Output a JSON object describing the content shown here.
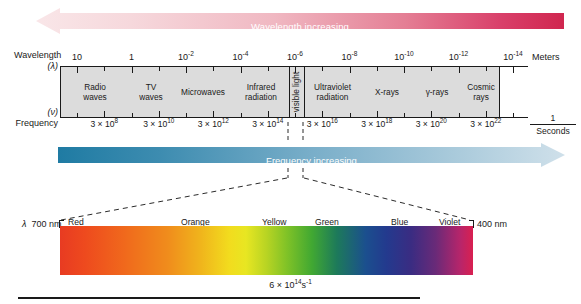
{
  "figure": {
    "top_arrow": {
      "label": "Wavelength increasing",
      "direction": "left",
      "color_start": "#f7dfe2",
      "color_end": "#d42a55"
    },
    "bottom_arrow": {
      "label": "Frequency increasing",
      "direction": "right",
      "color_start": "#2b7fa8",
      "color_end": "#c8dce8"
    },
    "wavelength_axis": {
      "caption_line1": "Wavelength",
      "caption_line2": "(λ)",
      "unit_label": "Meters",
      "tick_labels": [
        "10",
        "1",
        "10⁻²",
        "10⁻⁴",
        "10⁻⁶",
        "10⁻⁸",
        "10⁻¹⁰",
        "10⁻¹²",
        "10⁻¹⁴"
      ],
      "tick_bases": [
        "10",
        "1",
        "10",
        "10",
        "10",
        "10",
        "10",
        "10",
        "10"
      ],
      "tick_exponents": [
        "",
        "",
        "-2",
        "-4",
        "-6",
        "-8",
        "-10",
        "-12",
        "-14"
      ]
    },
    "frequency_axis": {
      "caption_line1": "(ν)",
      "caption_line2": "Frequency",
      "unit_numerator": "1",
      "unit_denominator": "Seconds",
      "tick_bases": [
        "3 × 10",
        "3 × 10",
        "3 × 10",
        "3 × 10",
        "3 × 10",
        "3 × 10",
        "3 × 10",
        "3 × 10"
      ],
      "tick_exponents": [
        "8",
        "10",
        "12",
        "14",
        "16",
        "18",
        "20",
        "22"
      ]
    },
    "bands": [
      {
        "name": "Radio waves",
        "line1": "Radio",
        "line2": "waves"
      },
      {
        "name": "TV waves",
        "line1": "TV",
        "line2": "waves"
      },
      {
        "name": "Microwaves",
        "line1": "Microwaves",
        "line2": ""
      },
      {
        "name": "Infrared radiation",
        "line1": "Infrared",
        "line2": "radiation"
      },
      {
        "name": "visible light",
        "line1": "visible light",
        "line2": ""
      },
      {
        "name": "Ultraviolet radiation",
        "line1": "Ultraviolet",
        "line2": "radiation"
      },
      {
        "name": "X-rays",
        "line1": "X-rays",
        "line2": ""
      },
      {
        "name": "gamma rays",
        "line1": "γ-rays",
        "line2": ""
      },
      {
        "name": "Cosmic rays",
        "line1": "Cosmic",
        "line2": "rays"
      }
    ],
    "visible_detail": {
      "left_wavelength_symbol": "λ",
      "left_wavelength": "700 nm",
      "right_wavelength": "400 nm",
      "colors": [
        "Red",
        "Orange",
        "Yellow",
        "Green",
        "Blue",
        "Violet"
      ],
      "frequency_note_base": "6 × 10",
      "frequency_note_exp": "14",
      "frequency_note_unit": "s",
      "frequency_note_unit_exp": "-1"
    }
  },
  "chart_data": {
    "type": "bar",
    "xlabel": "Wavelength (λ) / Meters",
    "ylabel": "",
    "categories": [
      "Radio waves",
      "TV waves",
      "Microwaves",
      "Infrared radiation",
      "visible light",
      "Ultraviolet radiation",
      "X-rays",
      "γ-rays",
      "Cosmic rays"
    ],
    "values": [
      1,
      1,
      1,
      1,
      1,
      1,
      1,
      1,
      1
    ],
    "wavelength_ticks_m": [
      10,
      1,
      0.01,
      0.0001,
      1e-06,
      1e-08,
      1e-10,
      1e-12,
      1e-14
    ],
    "wavelength_tick_labels": [
      "10",
      "1",
      "10^-2",
      "10^-4",
      "10^-6",
      "10^-8",
      "10^-10",
      "10^-12",
      "10^-14"
    ],
    "frequency_ticks_hz": [
      300000000.0,
      30000000000.0,
      3000000000000.0,
      300000000000000.0,
      3e+16,
      3e+18,
      3e+20,
      3e+22
    ],
    "frequency_tick_labels": [
      "3 x 10^8",
      "3 x 10^10",
      "3 x 10^12",
      "3 x 10^14",
      "3 x 10^16",
      "3 x 10^18",
      "3 x 10^20",
      "3 x 10^22"
    ],
    "visible_range_nm": [
      400,
      700
    ],
    "visible_colors": [
      "Red",
      "Orange",
      "Yellow",
      "Green",
      "Blue",
      "Violet"
    ],
    "visible_center_frequency_hz": 600000000000000.0,
    "grid": false,
    "legend": "none"
  }
}
